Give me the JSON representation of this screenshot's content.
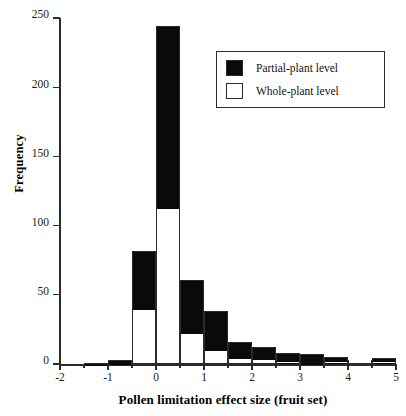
{
  "chart_data": {
    "type": "bar",
    "title": "",
    "subtitle": "",
    "xlabel": "Pollen limitation effect  size (fruit set)",
    "ylabel": "Frequency",
    "xlim": [
      -2,
      5
    ],
    "ylim": [
      0,
      250
    ],
    "bin_width": 0.5,
    "grid": false,
    "stacked": true,
    "xticks": [
      -2,
      -1,
      0,
      1,
      2,
      3,
      4,
      5
    ],
    "xtick_labels": [
      "-2",
      "-1",
      "0",
      "1",
      "2",
      "3",
      "4",
      "5"
    ],
    "xminor_ticks": [
      -1.5,
      -0.5,
      0.5,
      1.5,
      2.5,
      3.5,
      4.5
    ],
    "yticks": [
      0,
      50,
      100,
      150,
      200,
      250
    ],
    "ytick_labels": [
      "0",
      "50",
      "100",
      "150",
      "200",
      "250"
    ],
    "legend": {
      "position": "top-right",
      "entries": [
        {
          "label": "Partial-plant level",
          "color": "#0a0a0a",
          "fill": "black"
        },
        {
          "label": "Whole-plant level",
          "color": "#ffffff",
          "fill": "white"
        }
      ]
    },
    "bins": [
      {
        "x0": -2.0,
        "x1": -1.5,
        "whole_plant": 0,
        "partial_plant": 0,
        "total": 0
      },
      {
        "x0": -1.5,
        "x1": -1.0,
        "whole_plant": 0,
        "partial_plant": 1,
        "total": 1
      },
      {
        "x0": -1.0,
        "x1": -0.5,
        "whole_plant": 0,
        "partial_plant": 3,
        "total": 3
      },
      {
        "x0": -0.5,
        "x1": 0.0,
        "whole_plant": 38,
        "partial_plant": 44,
        "total": 82
      },
      {
        "x0": 0.0,
        "x1": 0.5,
        "whole_plant": 111,
        "partial_plant": 133,
        "total": 244
      },
      {
        "x0": 0.5,
        "x1": 1.0,
        "whole_plant": 21,
        "partial_plant": 40,
        "total": 61
      },
      {
        "x0": 1.0,
        "x1": 1.5,
        "whole_plant": 9,
        "partial_plant": 29,
        "total": 38
      },
      {
        "x0": 1.5,
        "x1": 2.0,
        "whole_plant": 3,
        "partial_plant": 13,
        "total": 16
      },
      {
        "x0": 2.0,
        "x1": 2.5,
        "whole_plant": 2,
        "partial_plant": 10,
        "total": 12
      },
      {
        "x0": 2.5,
        "x1": 3.0,
        "whole_plant": 1,
        "partial_plant": 7,
        "total": 8
      },
      {
        "x0": 3.0,
        "x1": 3.5,
        "whole_plant": 0,
        "partial_plant": 7,
        "total": 7
      },
      {
        "x0": 3.5,
        "x1": 4.0,
        "whole_plant": 1,
        "partial_plant": 4,
        "total": 5
      },
      {
        "x0": 4.0,
        "x1": 4.5,
        "whole_plant": 3,
        "partial_plant": 0,
        "total": 3
      },
      {
        "x0": 4.5,
        "x1": 5.0,
        "whole_plant": 1,
        "partial_plant": 3,
        "total": 4
      }
    ]
  }
}
